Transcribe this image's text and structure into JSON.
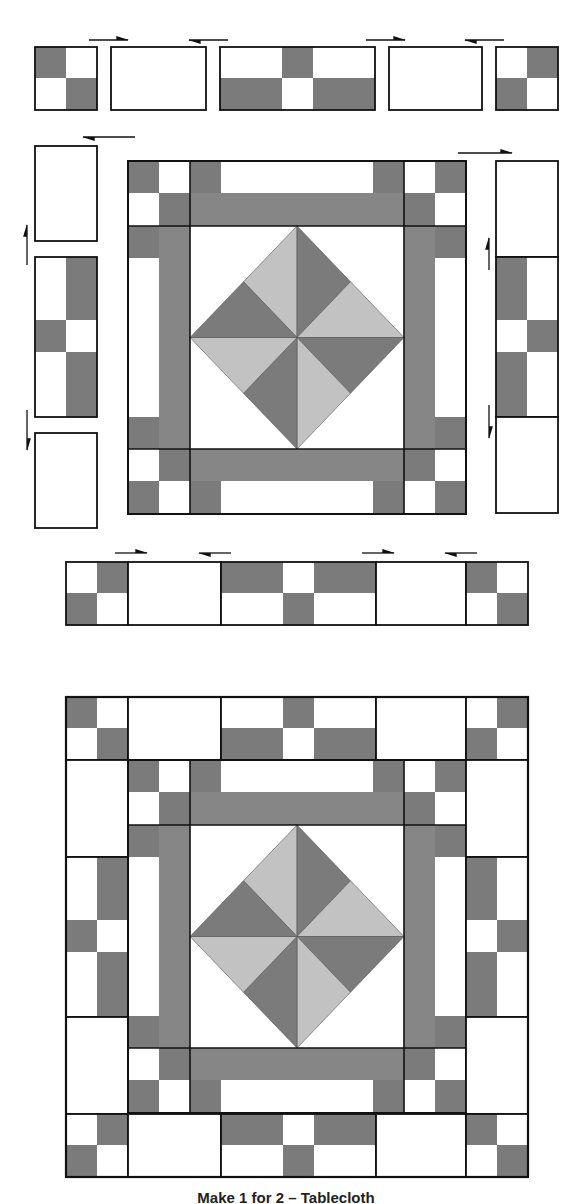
{
  "caption": "Make 1 for 2 – Tablecloth",
  "colors": {
    "background": "#ffffff",
    "dark": "#7b7b7b",
    "medium": "#868686",
    "light": "#c2c2c2",
    "white": "#ffffff",
    "outline": "#1a1a1a"
  },
  "sections": {
    "exploded_view": {
      "top_row_pieces": [
        "four-patch",
        "plain-rectangle",
        "three-block-strip",
        "plain-rectangle",
        "four-patch"
      ],
      "left_column_pieces": [
        "plain-rectangle",
        "patched-strip",
        "plain-rectangle"
      ],
      "right_column_pieces": [
        "plain-rectangle",
        "patched-strip",
        "plain-rectangle"
      ],
      "bottom_row_pieces": [
        "four-patch",
        "plain-rectangle",
        "three-block-strip",
        "plain-rectangle",
        "four-patch"
      ],
      "center": "pinwheel-diamond-block",
      "pressing_arrows": 12
    },
    "assembled_view": {
      "center": "pinwheel-diamond-block",
      "borders": "pieced"
    }
  }
}
